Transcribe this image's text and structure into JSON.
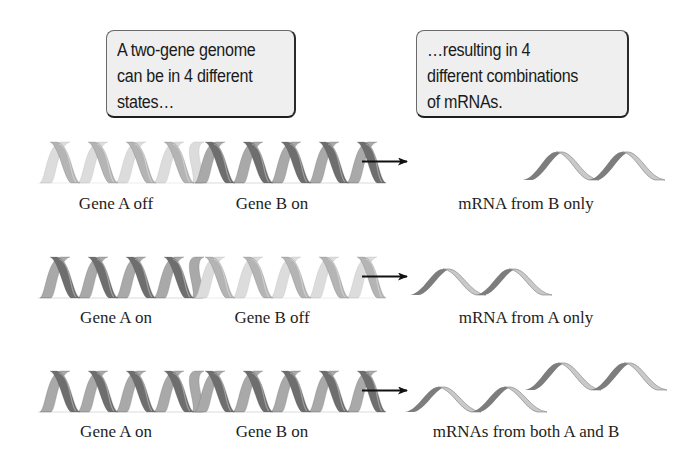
{
  "callouts": [
    {
      "id": "genome-states",
      "lines": [
        "A two-gene genome",
        "can be in 4 different",
        "states…"
      ]
    },
    {
      "id": "mrna-combinations",
      "lines": [
        "…resulting in 4",
        "different combinations",
        "of mRNAs."
      ]
    }
  ],
  "rows": [
    {
      "gene_a_label": "Gene A off",
      "gene_b_label": "Gene B on",
      "gene_a_state": "off",
      "gene_b_state": "on",
      "mrna_label": "mRNA from B only"
    },
    {
      "gene_a_label": "Gene A on",
      "gene_b_label": "Gene B off",
      "gene_a_state": "on",
      "gene_b_state": "off",
      "mrna_label": "mRNA from A only"
    },
    {
      "gene_a_label": "Gene A on",
      "gene_b_label": "Gene B on",
      "gene_a_state": "on",
      "gene_b_state": "on",
      "mrna_label": "mRNAs from both A and B"
    }
  ],
  "colors": {
    "gene_on_dark": "#6e6e6e",
    "gene_on_light": "#a9a9a9",
    "gene_off_dark": "#b4b4b4",
    "gene_off_light": "#dcdcdc",
    "mrna_dark": "#7d7d7d",
    "mrna_light": "#c9c9c9",
    "arrow": "#111111",
    "callout_fill": "#efefef"
  }
}
